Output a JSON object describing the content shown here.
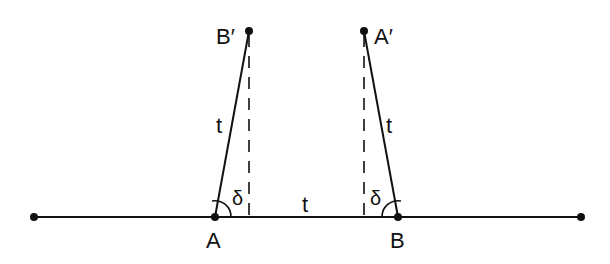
{
  "diagram": {
    "labels": {
      "A": "A",
      "B": "B",
      "A_prime": "A′",
      "B_prime": "B′",
      "t_left": "t",
      "t_middle": "t",
      "t_right": "t",
      "delta_left": "δ",
      "delta_right": "δ"
    },
    "colors": {
      "stroke": "#111111",
      "background": "#ffffff"
    }
  }
}
